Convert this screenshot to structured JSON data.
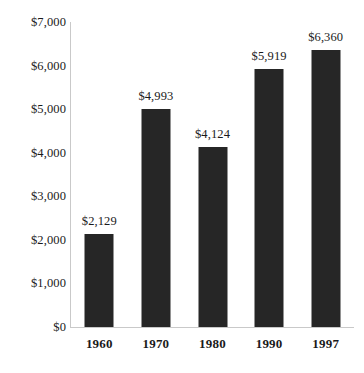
{
  "chart_data": {
    "type": "bar",
    "title": "",
    "subtitle": "",
    "xlabel": "",
    "ylabel": "",
    "categories": [
      "1960",
      "1970",
      "1980",
      "1990",
      "1997"
    ],
    "values": [
      2129,
      4993,
      4124,
      5919,
      6360
    ],
    "value_labels": [
      "$2,129",
      "$4,993",
      "$4,124",
      "$5,919",
      "$6,360"
    ],
    "ylim": [
      0,
      7000
    ],
    "ytick_values": [
      0,
      1000,
      2000,
      3000,
      4000,
      5000,
      6000,
      7000
    ],
    "ytick_labels": [
      "$0",
      "$1,000",
      "$2,000",
      "$3,000",
      "$4,000",
      "$5,000",
      "$6,000",
      "$7,000"
    ],
    "grid": false,
    "legend": null,
    "legend_position": "none",
    "bar_color": "#262626",
    "axis_color": "#c9c9c9",
    "text_color": "#1a1a1a",
    "background_color": "#ffffff"
  }
}
